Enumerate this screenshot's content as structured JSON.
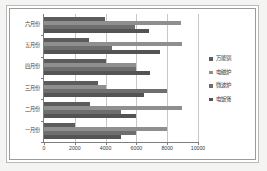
{
  "chart_data": {
    "type": "bar",
    "orientation": "horizontal",
    "title": "",
    "xlabel": "",
    "ylabel": "",
    "categories": [
      "六月份",
      "五月份",
      "四月份",
      "三月份",
      "二月份",
      "一月份"
    ],
    "series": [
      {
        "name": "万能锅",
        "color": "#5c5c5c",
        "values": [
          3950,
          2900,
          4000,
          3500,
          3000,
          2000
        ]
      },
      {
        "name": "电磁炉",
        "color": "#8f8f8f",
        "values": [
          8900,
          8950,
          6000,
          4000,
          8950,
          8000
        ]
      },
      {
        "name": "微波炉",
        "color": "#6e6e6e",
        "values": [
          5900,
          4400,
          6000,
          8000,
          5000,
          6000
        ]
      },
      {
        "name": "电饭煲",
        "color": "#545454",
        "values": [
          6800,
          7500,
          6900,
          6500,
          6000,
          5000
        ]
      }
    ],
    "xticks": [
      "0",
      "2000",
      "4000",
      "6000",
      "8000",
      "10000"
    ],
    "xlim": [
      0,
      10000
    ],
    "grid": true,
    "legend_position": "right"
  },
  "legend": {
    "items": [
      {
        "label": "万能锅"
      },
      {
        "label": "电磁炉"
      },
      {
        "label": "微波炉"
      },
      {
        "label": "电饭煲"
      }
    ]
  },
  "axis": {
    "x_ticks": [
      "0",
      "2000",
      "4000",
      "6000",
      "8000",
      "10000"
    ],
    "y_ticks": [
      "六月份",
      "五月份",
      "四月份",
      "三月份",
      "二月份",
      "一月份"
    ]
  }
}
